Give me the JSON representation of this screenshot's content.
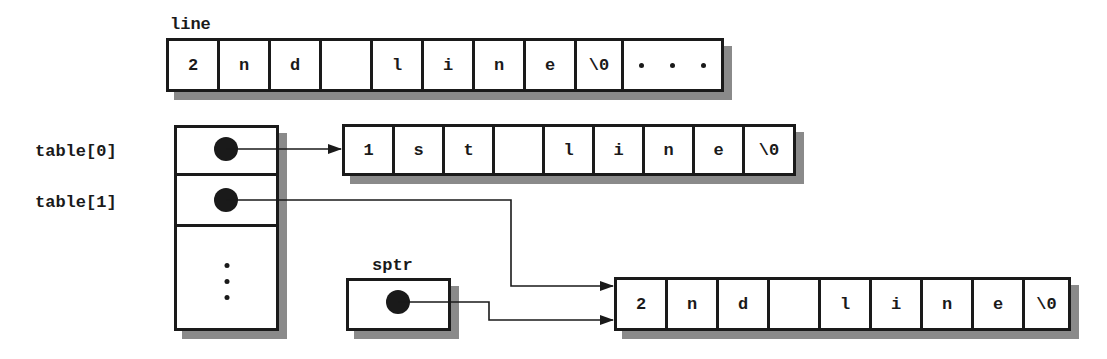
{
  "line": {
    "label": "line",
    "cells": [
      "2",
      "n",
      "d",
      " ",
      "l",
      "i",
      "n",
      "e",
      "\\0",
      ""
    ],
    "trailing": "ellipsis"
  },
  "table": {
    "labels": [
      "table[0]",
      "table[1]"
    ],
    "rows": [
      {
        "type": "pointer",
        "target": "first-string"
      },
      {
        "type": "pointer",
        "target": "second-string"
      },
      {
        "type": "ellipsis"
      }
    ]
  },
  "first_string": {
    "cells": [
      "1",
      "s",
      "t",
      " ",
      "l",
      "i",
      "n",
      "e",
      "\\0"
    ]
  },
  "sptr": {
    "label": "sptr",
    "target": "second-string"
  },
  "second_string": {
    "cells": [
      "2",
      "n",
      "d",
      " ",
      "l",
      "i",
      "n",
      "e",
      "\\0"
    ]
  },
  "colors": {
    "stroke": "#1a1a1a",
    "shadow": "#8a8a8a",
    "background": "#ffffff"
  }
}
